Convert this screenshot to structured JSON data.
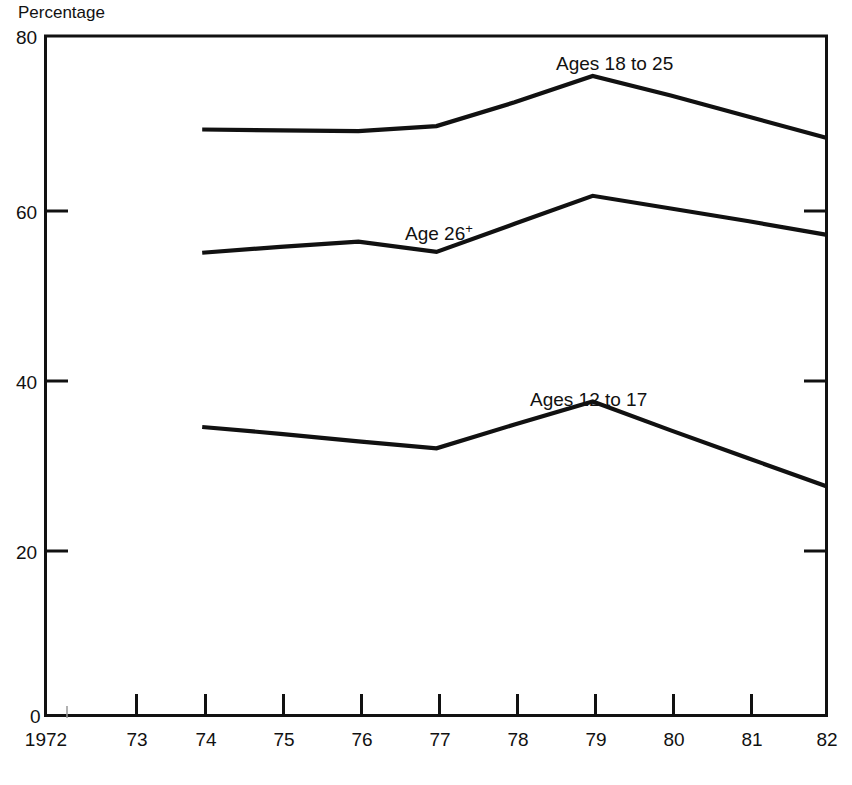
{
  "chart_data": {
    "type": "line",
    "title": "",
    "subtitle": "",
    "ylabel": "Percentage",
    "xlabel": "",
    "ylim": [
      0,
      80
    ],
    "y_ticks": [
      0,
      20,
      40,
      60,
      80
    ],
    "y_tick_labels": [
      "0",
      "20",
      "40",
      "60",
      "80"
    ],
    "x_ticks": [
      1972,
      1973,
      1974,
      1975,
      1976,
      1977,
      1978,
      1979,
      1980,
      1981,
      1982
    ],
    "x_tick_labels": [
      "1972",
      "73",
      "74",
      "75",
      "76",
      "77",
      "78",
      "79",
      "80",
      "81",
      "82"
    ],
    "xlim": [
      1972,
      1982
    ],
    "grid": false,
    "legend_position": "inline-annotations",
    "series": [
      {
        "name": "Ages 18 to 25",
        "label": "Ages 18 to 25",
        "label_sup": "",
        "x": [
          1974,
          1975,
          1976,
          1977,
          1978,
          1979,
          1980,
          1981,
          1982
        ],
        "values": [
          69.0,
          68.9,
          68.8,
          69.4,
          72.2,
          75.3,
          73.0,
          70.5,
          68.0
        ]
      },
      {
        "name": "Age 26+",
        "label": "Age 26",
        "label_sup": "+",
        "x": [
          1974,
          1975,
          1976,
          1977,
          1978,
          1979,
          1980,
          1981,
          1982
        ],
        "values": [
          54.5,
          55.2,
          55.8,
          54.6,
          57.9,
          61.2,
          59.7,
          58.2,
          56.6
        ]
      },
      {
        "name": "Ages 12 to 17",
        "label": "Ages 12 to 17",
        "label_sup": "",
        "x": [
          1974,
          1975,
          1976,
          1977,
          1978,
          1979,
          1980,
          1981,
          1982
        ],
        "values": [
          34.0,
          33.2,
          32.3,
          31.5,
          34.3,
          37.0,
          33.6,
          30.3,
          27.0
        ]
      }
    ],
    "annotations": [
      {
        "text": "Ages 18 to 25",
        "x": 1978.3,
        "y": 79.0
      },
      {
        "text": "Age 26",
        "sup": "+",
        "x": 1976.6,
        "y": 60.0
      },
      {
        "text": "Ages 12 to 17",
        "x": 1977.8,
        "y": 42.5
      }
    ]
  },
  "axes": {
    "y_axis_title": "Percentage",
    "y_labels": [
      "80",
      "60",
      "40",
      "20",
      "0"
    ],
    "x_labels": [
      "1972",
      "73",
      "74",
      "75",
      "76",
      "77",
      "78",
      "79",
      "80",
      "81",
      "82"
    ]
  },
  "colors": {
    "line": "#111111",
    "axis": "#111111",
    "background": "#ffffff"
  }
}
